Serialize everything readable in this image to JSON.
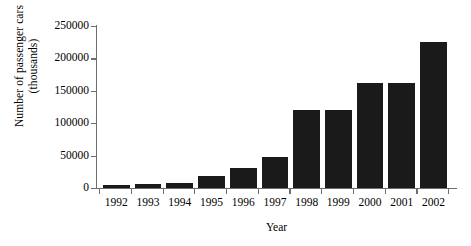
{
  "chart_data": {
    "type": "bar",
    "title": "",
    "xlabel": "Year",
    "ylabel": "Number of passenger cars (thousands)",
    "ylabel_lines": [
      "Number of passenger cars",
      "(thousands)"
    ],
    "categories": [
      "1992",
      "1993",
      "1994",
      "1995",
      "1996",
      "1997",
      "1998",
      "1999",
      "2000",
      "2001",
      "2002"
    ],
    "values": [
      5000,
      6000,
      7500,
      19000,
      31000,
      48000,
      120000,
      120000,
      162000,
      162000,
      225000
    ],
    "ylim": [
      0,
      250000
    ],
    "yticks": [
      0,
      50000,
      100000,
      150000,
      200000,
      250000
    ],
    "ytick_labels": [
      "0",
      "50000",
      "100000",
      "150000",
      "200000",
      "250000"
    ],
    "xtick_labels": [
      "1992",
      "1993",
      "1994",
      "1995",
      "1996",
      "1997",
      "1998",
      "1999",
      "2000",
      "2001",
      "2002"
    ],
    "grid": false,
    "legend": null,
    "bar_color": "#1a1a1a",
    "axis_color": "#6e6e6e",
    "background": "#ffffff"
  }
}
